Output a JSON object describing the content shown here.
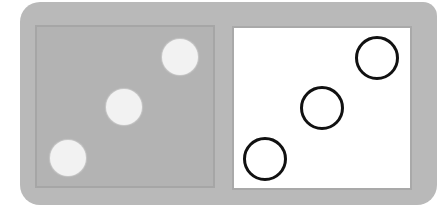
{
  "figure": {
    "colors": {
      "tile": "#b9b9b9",
      "left_panel": "#b3b3b3",
      "right_panel": "#ffffff",
      "filled_pip": "#f2f2f2",
      "outline_pip": "#111111"
    },
    "left_half": {
      "pip_count": 3,
      "pips": [
        {
          "cx": 180,
          "cy": 57,
          "r": 18
        },
        {
          "cx": 124,
          "cy": 107,
          "r": 18
        },
        {
          "cx": 68,
          "cy": 158,
          "r": 18
        }
      ]
    },
    "right_half": {
      "circle_count": 3,
      "circles": [
        {
          "cx": 377,
          "cy": 58,
          "r": 22
        },
        {
          "cx": 322,
          "cy": 108,
          "r": 22
        },
        {
          "cx": 265,
          "cy": 159,
          "r": 22
        }
      ]
    }
  }
}
